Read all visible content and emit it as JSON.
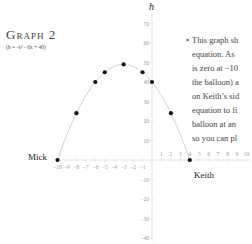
{
  "title": "Graph 2",
  "subtitle": "(h = -x² - 6x + 40)",
  "note": {
    "bullet": "•",
    "lines": [
      "This graph sh",
      "equation. As",
      "is zero at −10",
      "the balloon) a",
      "on Keith’s sid",
      "equation to fi",
      "balloon at an",
      "so you can pl"
    ]
  },
  "labels": {
    "left_person": "Mick",
    "right_person": "Keith",
    "y_axis": "h"
  },
  "chart_data": {
    "type": "line",
    "title": "Graph 2",
    "subtitle": "(h = -x² - 6x + 40)",
    "xlabel": "",
    "ylabel": "h",
    "xlim": [
      -10,
      10
    ],
    "ylim": [
      -40,
      70
    ],
    "x_ticks": [
      -10,
      -9,
      -8,
      -7,
      -6,
      -5,
      -4,
      -3,
      -2,
      -1,
      1,
      2,
      3,
      4,
      5,
      6,
      7,
      8,
      9,
      10
    ],
    "y_ticks": [
      70,
      60,
      50,
      40,
      30,
      20,
      10,
      -10,
      -20,
      -30,
      -40
    ],
    "series": [
      {
        "name": "h = -x² - 6x + 40",
        "kind": "curve",
        "x_range": [
          -10,
          4
        ]
      },
      {
        "name": "points",
        "kind": "scatter",
        "x": [
          -10,
          -8,
          -6,
          -5,
          -3,
          -1,
          0,
          2,
          4
        ],
        "y": [
          0,
          24,
          40,
          45,
          49,
          45,
          40,
          24,
          0
        ]
      }
    ],
    "annotations": [
      {
        "text": "Mick",
        "x": -10,
        "y": 0
      },
      {
        "text": "Keith",
        "x": 4,
        "y": 0
      }
    ],
    "grid": false
  }
}
